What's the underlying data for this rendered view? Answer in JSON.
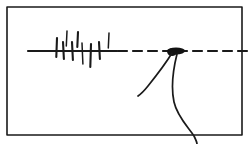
{
  "figure": {
    "medium": "scanned pen-and-ink sketch",
    "background_color": "#ffffff",
    "ink_color": "#1a1a1a",
    "width": 251,
    "height": 144
  },
  "frame": {
    "name": "rectangular border",
    "x": 7,
    "y": 7,
    "width": 235,
    "height": 128,
    "stroke_width": 1.6
  },
  "axis_line": {
    "name": "solid horizontal baseline",
    "y": 51,
    "x_start": 28,
    "x_end": 117,
    "stroke_width": 2.2
  },
  "dashed_line": {
    "name": "dashed horizontal continuation",
    "y": 51,
    "x_start": 118,
    "x_end": 248,
    "stroke_width": 2.2,
    "dash_pattern": "9 6"
  },
  "tick_marks": {
    "name": "vertical hatch strokes crossing the baseline",
    "count": 9,
    "marks": [
      {
        "x": 57,
        "y_top": 38,
        "y_bottom": 57
      },
      {
        "x": 63,
        "y_top": 42,
        "y_bottom": 59
      },
      {
        "x": 67,
        "y_top": 31,
        "y_bottom": 46
      },
      {
        "x": 72,
        "y_top": 42,
        "y_bottom": 60
      },
      {
        "x": 78,
        "y_top": 32,
        "y_bottom": 47
      },
      {
        "x": 82,
        "y_top": 43,
        "y_bottom": 64
      },
      {
        "x": 91,
        "y_top": 44,
        "y_bottom": 67
      },
      {
        "x": 99,
        "y_top": 42,
        "y_bottom": 59
      },
      {
        "x": 109,
        "y_top": 33,
        "y_bottom": 48
      }
    ]
  },
  "node_blob": {
    "name": "ink blob junction node",
    "cx": 176,
    "cy": 51,
    "rx": 9,
    "ry": 3.4
  },
  "curves": [
    {
      "name": "left descending curve",
      "from": [
        172,
        53
      ],
      "to": [
        138,
        96
      ],
      "path": "M 172 53 C 166 63, 156 76, 148 86 C 144 91, 141 94, 138 96"
    },
    {
      "name": "right s-shaped descending curve",
      "from": [
        177,
        54
      ],
      "to": [
        197,
        144
      ],
      "path": "M 177 54 C 173 70, 171 88, 174 102 C 177 116, 188 127, 194 136 C 196 140, 197 142, 197 144"
    }
  ],
  "labels": {
    "visible_text": []
  }
}
